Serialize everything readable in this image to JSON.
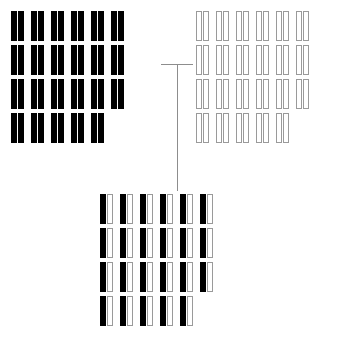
{
  "diagram": {
    "canvas": {
      "width": 356,
      "height": 343
    },
    "colors": {
      "filled": "#000000",
      "outline_stroke": "#9a9a9a",
      "outline_fill": "#ffffff",
      "connector": "#8d8d8d",
      "background": "#ffffff"
    },
    "bar_metrics": {
      "bar_width": 6,
      "bar_height": 30,
      "intra_pair_gap": 1,
      "inter_pair_gap": 7,
      "row_gap": 4,
      "row_pitch": 34
    },
    "groups": [
      {
        "id": "parent-black",
        "label": "Top-left parent genome",
        "position": {
          "left": 11,
          "top": 11
        },
        "style": "all-filled",
        "pair_count": 23,
        "rows": [
          {
            "index": 1,
            "pairs": 6,
            "pattern": [
              "filled",
              "filled"
            ]
          },
          {
            "index": 2,
            "pairs": 6,
            "pattern": [
              "filled",
              "filled"
            ]
          },
          {
            "index": 3,
            "pairs": 6,
            "pattern": [
              "filled",
              "filled"
            ]
          },
          {
            "index": 4,
            "pairs": 5,
            "pattern": [
              "filled",
              "filled"
            ]
          }
        ]
      },
      {
        "id": "parent-white",
        "label": "Top-right parent genome",
        "position": {
          "left": 196,
          "top": 11
        },
        "style": "all-outline",
        "pair_count": 23,
        "rows": [
          {
            "index": 1,
            "pairs": 6,
            "pattern": [
              "outline",
              "outline"
            ]
          },
          {
            "index": 2,
            "pairs": 6,
            "pattern": [
              "outline",
              "outline"
            ]
          },
          {
            "index": 3,
            "pairs": 6,
            "pattern": [
              "outline",
              "outline"
            ]
          },
          {
            "index": 4,
            "pairs": 5,
            "pattern": [
              "outline",
              "outline"
            ]
          }
        ]
      },
      {
        "id": "offspring-mixed",
        "label": "Offspring hybrid genome",
        "position": {
          "left": 100,
          "top": 194
        },
        "style": "alternating",
        "pair_count": 23,
        "rows": [
          {
            "index": 1,
            "pairs": 6,
            "pattern": [
              "filled",
              "outline"
            ]
          },
          {
            "index": 2,
            "pairs": 6,
            "pattern": [
              "filled",
              "outline"
            ]
          },
          {
            "index": 3,
            "pairs": 6,
            "pattern": [
              "filled",
              "outline"
            ]
          },
          {
            "index": 4,
            "pairs": 5,
            "pattern": [
              "filled",
              "outline"
            ]
          }
        ]
      }
    ],
    "connectors": [
      {
        "id": "cross-bar",
        "label": "Horizontal cross connector",
        "orientation": "horizontal",
        "left": 161,
        "top": 64,
        "length": 32
      },
      {
        "id": "descent-line",
        "label": "Vertical descent connector",
        "orientation": "vertical",
        "left": 177,
        "top": 64,
        "length": 127
      }
    ]
  }
}
